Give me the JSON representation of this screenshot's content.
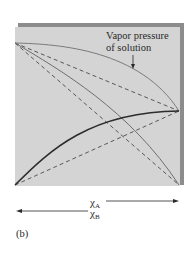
{
  "figure": {
    "panel_label": "(b)",
    "annotation": {
      "line1": "Vapor pressure",
      "line2": "of solution"
    },
    "axis": {
      "x_a_symbol": "χ",
      "x_a_subscript": "A",
      "x_b_symbol": "χ",
      "x_b_subscript": "B",
      "x_a_direction": "right",
      "x_b_direction": "left"
    },
    "colors": {
      "plot_background": "#d4d4d4",
      "shadow": "#8c8c8c",
      "curve_solution": "#7a7a7a",
      "curve_thin": "#6e6e6e",
      "curve_thick": "#2c2c2c",
      "dashed": "#4a4a4a"
    },
    "curves": [
      {
        "name": "solution-vapor-pressure",
        "style": "solid",
        "description": "positive deviation total pressure, from top-left to right-middle, bowed upward"
      },
      {
        "name": "ideal-total-pressure",
        "style": "dashed",
        "description": "straight line top-left to right-middle"
      },
      {
        "name": "component-b-partial-pressure",
        "style": "solid",
        "description": "from top-left to bottom-right, bowed upward"
      },
      {
        "name": "ideal-b-partial-pressure",
        "style": "dashed",
        "description": "straight line top-left to bottom-right"
      },
      {
        "name": "component-a-partial-pressure",
        "style": "solid-thick",
        "description": "from bottom-left to right-middle, bowed upward"
      },
      {
        "name": "ideal-a-partial-pressure",
        "style": "dashed",
        "description": "straight line bottom-left to right-middle"
      }
    ]
  }
}
